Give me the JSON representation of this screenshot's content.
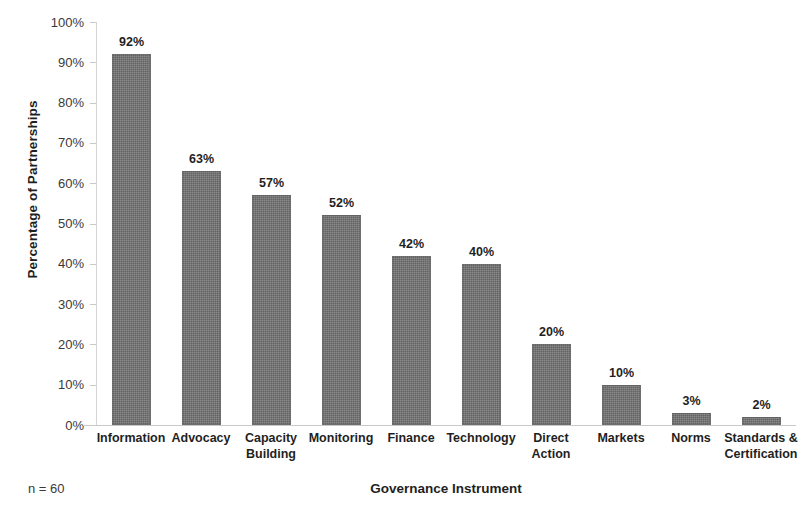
{
  "chart_data": {
    "type": "bar",
    "title": "",
    "xlabel": "Governance Instrument",
    "ylabel": "Percentage of Partnerships",
    "categories": [
      "Information",
      "Advocacy",
      "Capacity Building",
      "Monitoring",
      "Finance",
      "Technology",
      "Direct Action",
      "Markets",
      "Norms",
      "Standards & Certification"
    ],
    "category_lines": [
      [
        "Information"
      ],
      [
        "Advocacy"
      ],
      [
        "Capacity",
        "Building"
      ],
      [
        "Monitoring"
      ],
      [
        "Finance"
      ],
      [
        "Technology"
      ],
      [
        "Direct",
        "Action"
      ],
      [
        "Markets"
      ],
      [
        "Norms"
      ],
      [
        "Standards &",
        "Certification"
      ]
    ],
    "values": [
      92,
      63,
      57,
      52,
      42,
      40,
      20,
      10,
      3,
      2
    ],
    "data_labels": [
      "92%",
      "63%",
      "57%",
      "52%",
      "42%",
      "40%",
      "20%",
      "10%",
      "3%",
      "2%"
    ],
    "ylim": [
      0,
      100
    ],
    "ytick_values": [
      0,
      10,
      20,
      30,
      40,
      50,
      60,
      70,
      80,
      90,
      100
    ],
    "ytick_labels": [
      "0%",
      "10%",
      "20%",
      "30%",
      "40%",
      "50%",
      "60%",
      "70%",
      "80%",
      "90%",
      "100%"
    ],
    "grid": false,
    "legend": false,
    "bar_color": "#6e6e6e",
    "axis_color": "#c9c9c9",
    "text_color": "#1f1f1f"
  },
  "annotations": {
    "sample_size": "n = 60"
  }
}
